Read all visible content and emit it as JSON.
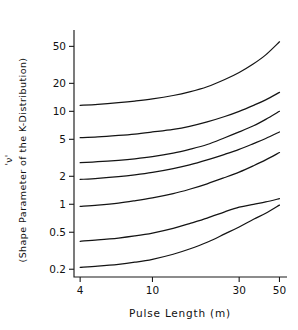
{
  "chart_data": {
    "type": "line",
    "title": "",
    "xlabel": "Pulse Length (m)",
    "ylabel_symbol": "'ν'",
    "ylabel_text": "(Shape Parameter of the K-Distribution)",
    "xscale": "log",
    "yscale": "log",
    "xlim": [
      3.7,
      55
    ],
    "ylim": [
      0.165,
      75
    ],
    "grid": false,
    "legend": "none",
    "xticks": [
      4,
      10,
      30,
      50
    ],
    "xtick_labels": [
      "4",
      "10",
      "30",
      "50"
    ],
    "yticks": [
      0.2,
      0.5,
      1,
      2,
      5,
      10,
      20,
      50
    ],
    "ytick_labels": [
      "0.2",
      "0.5",
      "1",
      "2",
      "5",
      "10",
      "20",
      "50"
    ],
    "x": [
      4,
      5,
      6.5,
      8,
      10,
      13,
      16,
      20,
      25,
      30,
      36,
      42,
      50
    ],
    "series": [
      {
        "name": "curve-1",
        "values": [
          11.6,
          11.9,
          12.4,
          12.9,
          13.6,
          14.8,
          16.2,
          18.4,
          22.0,
          26.2,
          32.5,
          40.5,
          56.0
        ]
      },
      {
        "name": "curve-2",
        "values": [
          5.2,
          5.3,
          5.5,
          5.7,
          6.0,
          6.4,
          6.9,
          7.7,
          8.8,
          10.0,
          11.6,
          13.3,
          16.0
        ]
      },
      {
        "name": "curve-3",
        "values": [
          2.8,
          2.87,
          2.97,
          3.08,
          3.25,
          3.55,
          3.9,
          4.4,
          5.2,
          6.0,
          7.0,
          8.2,
          10.0
        ]
      },
      {
        "name": "curve-4",
        "values": [
          1.85,
          1.9,
          1.98,
          2.07,
          2.2,
          2.42,
          2.65,
          3.0,
          3.45,
          3.9,
          4.5,
          5.1,
          6.0
        ]
      },
      {
        "name": "curve-5",
        "values": [
          0.95,
          0.98,
          1.03,
          1.09,
          1.17,
          1.3,
          1.45,
          1.66,
          1.94,
          2.22,
          2.6,
          3.0,
          3.6
        ]
      },
      {
        "name": "curve-6",
        "values": [
          0.4,
          0.413,
          0.433,
          0.456,
          0.49,
          0.55,
          0.62,
          0.71,
          0.83,
          0.93,
          1.0,
          1.06,
          1.15
        ]
      },
      {
        "name": "curve-7",
        "values": [
          0.21,
          0.216,
          0.226,
          0.238,
          0.256,
          0.29,
          0.33,
          0.39,
          0.48,
          0.57,
          0.69,
          0.8,
          0.98
        ]
      }
    ]
  }
}
